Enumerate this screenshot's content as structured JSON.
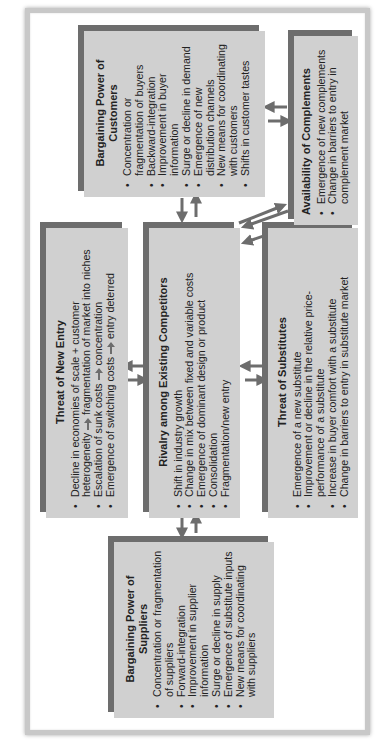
{
  "colors": {
    "box_fill": "#d0d0d0",
    "box_shadow_bar": "#6d6d6d",
    "arrow": "#6d6d6d",
    "frame": "#c8c8c8",
    "text": "#222222"
  },
  "orientation": "rotated 90 degrees counter-clockwise",
  "boxes": {
    "customers": {
      "title": "Bargaining Power of Customers",
      "items": [
        "Concentration or fragmentation of buyers",
        "Backward-integration",
        "Improvement in buyer information",
        "Surge or decline in demand",
        "Emergence of new distribution channels",
        "New means for coordinating with customers",
        "Shifts in customer tastes"
      ]
    },
    "complements": {
      "title": "Availability of Complements",
      "items": [
        "Emergence of new complements",
        "Change in barriers to entry in complement market"
      ]
    },
    "new_entry": {
      "title": "Threat of New Entry",
      "items": [
        {
          "before": "Decline in economies of scale + customer heterogeneity",
          "arrow": true,
          "after": "fragmentation of market into niches"
        },
        {
          "before": "Escalation of sunk costs",
          "arrow": true,
          "after": "concentration"
        },
        {
          "before": "Emergence of switching costs",
          "arrow": true,
          "after": "entry deterred"
        }
      ]
    },
    "rivalry": {
      "title": "Rivalry among Existing Competitors",
      "items": [
        "Shift in industry growth",
        "Change in mix between fixed and variable costs",
        "Emergence of dominant design or product",
        "Consolidation",
        "Fragmentation/new entry"
      ]
    },
    "substitutes": {
      "title": "Threat of Substitutes",
      "items": [
        "Emergence of a new substitute",
        "Improvement or decline in the relative price-performance of a substitute",
        "Increase in buyer comfort with a substitute",
        "Change in barriers to entry in substitute market"
      ]
    },
    "suppliers": {
      "title": "Bargaining Power of Suppliers",
      "items": [
        "Concentration or fragmentation of suppliers",
        "Forward-integration",
        "Improvement in supplier information",
        "Surge or decline in supply",
        "Emergence of substitute inputs",
        "New means for coordinating with suppliers"
      ]
    }
  },
  "connections": [
    {
      "from": "rivalry",
      "to": "customers",
      "bidirectional": true
    },
    {
      "from": "rivalry",
      "to": "suppliers",
      "bidirectional": true
    },
    {
      "from": "rivalry",
      "to": "new_entry",
      "bidirectional": true
    },
    {
      "from": "rivalry",
      "to": "substitutes",
      "bidirectional": true
    },
    {
      "from": "rivalry",
      "to": "complements",
      "bidirectional": true
    },
    {
      "from": "customers",
      "to": "complements",
      "bidirectional": true
    }
  ]
}
